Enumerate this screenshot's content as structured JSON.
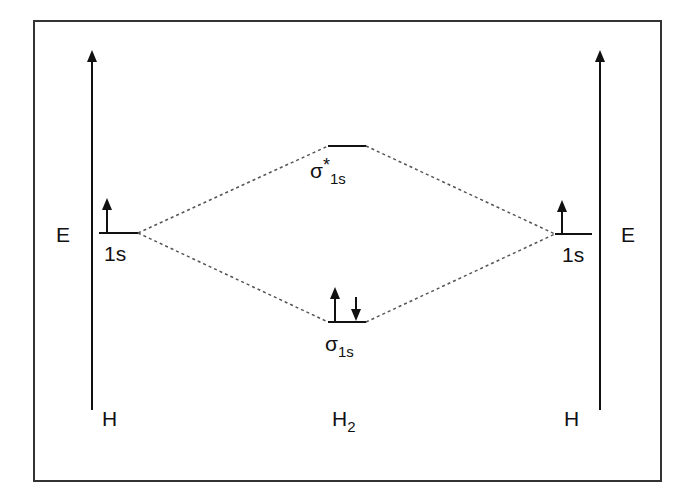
{
  "diagram": {
    "axis_label_left": "E",
    "axis_label_right": "E",
    "left_atom": {
      "label": "H",
      "orbital": {
        "name": "1s",
        "electrons": [
          "up"
        ]
      }
    },
    "right_atom": {
      "label": "H",
      "orbital": {
        "name": "1s",
        "electrons": [
          "up"
        ]
      }
    },
    "molecule": {
      "label_main": "H",
      "label_sub": "2",
      "antibonding": {
        "symbol": "σ",
        "star": "*",
        "sub": "1s",
        "electrons": []
      },
      "bonding": {
        "symbol": "σ",
        "sub": "1s",
        "electrons": [
          "up",
          "down"
        ]
      }
    },
    "colors": {
      "line": "#111111",
      "dotted": "#555555",
      "frame": "#333333",
      "background": "#ffffff"
    }
  }
}
